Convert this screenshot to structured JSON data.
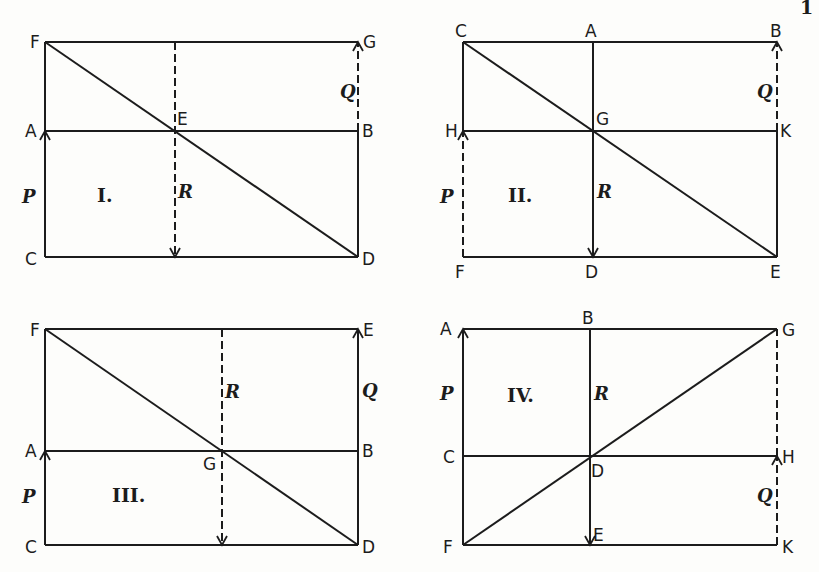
{
  "figure": {
    "corner_mark": "1"
  },
  "panels": [
    {
      "numeral": "I.",
      "points": {
        "F": [
          45,
          42
        ],
        "G": [
          358,
          42
        ],
        "A": [
          45,
          131
        ],
        "E": [
          175,
          131
        ],
        "B": [
          358,
          131
        ],
        "C": [
          45,
          257
        ],
        "D": [
          358,
          257
        ]
      },
      "labels": [
        {
          "text": "F",
          "x": 30,
          "y": 48
        },
        {
          "text": "G",
          "x": 363,
          "y": 48
        },
        {
          "text": "A",
          "x": 25,
          "y": 137
        },
        {
          "text": "E",
          "x": 177,
          "y": 125
        },
        {
          "text": "B",
          "x": 362,
          "y": 137
        },
        {
          "text": "C",
          "x": 25,
          "y": 265
        },
        {
          "text": "D",
          "x": 362,
          "y": 265
        }
      ],
      "forces": [
        {
          "text": "P",
          "x": 22,
          "y": 203
        },
        {
          "text": "Q",
          "x": 340,
          "y": 98
        },
        {
          "text": "R",
          "x": 178,
          "y": 198
        }
      ],
      "numeral_pos": [
        97,
        202
      ],
      "lines": [
        {
          "from": "F",
          "to": "G",
          "style": "solid"
        },
        {
          "from": "A",
          "to": "B",
          "style": "solid"
        },
        {
          "from": "C",
          "to": "D",
          "style": "solid"
        },
        {
          "from": "C",
          "to": "F",
          "style": "solid"
        },
        {
          "from": "B",
          "to": "D",
          "style": "solid"
        },
        {
          "from": "F",
          "to": "D",
          "style": "solid",
          "name": "diagonal"
        },
        {
          "from": [
            175,
            42
          ],
          "to": [
            175,
            257
          ],
          "style": "dashed",
          "arrow": "end",
          "name": "resultant-R"
        },
        {
          "from": "B",
          "to": "G",
          "style": "dashed",
          "arrow": "end",
          "name": "force-Q"
        },
        {
          "from": "C",
          "to": "A",
          "style": "solid",
          "arrow": "end",
          "name": "force-P"
        }
      ]
    },
    {
      "numeral": "II.",
      "points": {
        "C": [
          463,
          42
        ],
        "A": [
          593,
          42
        ],
        "B": [
          777,
          42
        ],
        "H": [
          463,
          131
        ],
        "G": [
          593,
          131
        ],
        "K": [
          777,
          131
        ],
        "F": [
          463,
          257
        ],
        "D": [
          593,
          257
        ],
        "E": [
          777,
          257
        ]
      },
      "labels": [
        {
          "text": "C",
          "x": 455,
          "y": 37
        },
        {
          "text": "A",
          "x": 585,
          "y": 37
        },
        {
          "text": "B",
          "x": 770,
          "y": 37
        },
        {
          "text": "H",
          "x": 445,
          "y": 137
        },
        {
          "text": "G",
          "x": 596,
          "y": 125
        },
        {
          "text": "K",
          "x": 780,
          "y": 137
        },
        {
          "text": "F",
          "x": 455,
          "y": 278
        },
        {
          "text": "D",
          "x": 585,
          "y": 278
        },
        {
          "text": "E",
          "x": 770,
          "y": 278
        }
      ],
      "forces": [
        {
          "text": "P",
          "x": 440,
          "y": 203
        },
        {
          "text": "Q",
          "x": 757,
          "y": 98
        },
        {
          "text": "R",
          "x": 597,
          "y": 198
        }
      ],
      "numeral_pos": [
        508,
        202
      ],
      "lines": [
        {
          "from": "C",
          "to": "B",
          "style": "solid"
        },
        {
          "from": "H",
          "to": "K",
          "style": "solid"
        },
        {
          "from": "F",
          "to": "E",
          "style": "solid"
        },
        {
          "from": "C",
          "to": "H",
          "style": "solid"
        },
        {
          "from": "K",
          "to": "E",
          "style": "solid"
        },
        {
          "from": "C",
          "to": "E",
          "style": "solid",
          "name": "diagonal"
        },
        {
          "from": "A",
          "to": "D",
          "style": "solid",
          "arrow": "end",
          "name": "resultant-R"
        },
        {
          "from": "K",
          "to": "B",
          "style": "dashed",
          "arrow": "end",
          "name": "force-Q"
        },
        {
          "from": "F",
          "to": "H",
          "style": "dashed",
          "arrow": "end",
          "name": "force-P"
        }
      ]
    },
    {
      "numeral": "III.",
      "points": {
        "F": [
          45,
          329
        ],
        "E": [
          358,
          329
        ],
        "A": [
          45,
          451
        ],
        "G": [
          222,
          451
        ],
        "B": [
          358,
          451
        ],
        "C": [
          45,
          545
        ],
        "D": [
          358,
          545
        ]
      },
      "labels": [
        {
          "text": "F",
          "x": 30,
          "y": 336
        },
        {
          "text": "E",
          "x": 363,
          "y": 336
        },
        {
          "text": "A",
          "x": 25,
          "y": 457
        },
        {
          "text": "G",
          "x": 203,
          "y": 470
        },
        {
          "text": "B",
          "x": 362,
          "y": 457
        },
        {
          "text": "C",
          "x": 25,
          "y": 553
        },
        {
          "text": "D",
          "x": 362,
          "y": 553
        }
      ],
      "forces": [
        {
          "text": "P",
          "x": 22,
          "y": 503
        },
        {
          "text": "Q",
          "x": 362,
          "y": 397
        },
        {
          "text": "R",
          "x": 225,
          "y": 398
        }
      ],
      "numeral_pos": [
        112,
        502
      ],
      "lines": [
        {
          "from": "F",
          "to": "E",
          "style": "solid"
        },
        {
          "from": "A",
          "to": "B",
          "style": "solid"
        },
        {
          "from": "C",
          "to": "D",
          "style": "solid"
        },
        {
          "from": "C",
          "to": "F",
          "style": "solid"
        },
        {
          "from": "D",
          "to": "B",
          "style": "solid"
        },
        {
          "from": "F",
          "to": "D",
          "style": "solid",
          "name": "diagonal"
        },
        {
          "from": [
            222,
            329
          ],
          "to": [
            222,
            545
          ],
          "style": "dashed",
          "arrow": "end",
          "name": "resultant-R"
        },
        {
          "from": "B",
          "to": "E",
          "style": "solid",
          "arrow": "end",
          "name": "force-Q"
        },
        {
          "from": "C",
          "to": "A",
          "style": "solid",
          "arrow": "end",
          "name": "force-P"
        }
      ]
    },
    {
      "numeral": "IV.",
      "points": {
        "A": [
          463,
          329
        ],
        "B": [
          590,
          329
        ],
        "G": [
          777,
          329
        ],
        "C": [
          463,
          456
        ],
        "D": [
          590,
          456
        ],
        "H": [
          777,
          456
        ],
        "F": [
          463,
          545
        ],
        "E": [
          590,
          545
        ],
        "K": [
          777,
          545
        ]
      },
      "labels": [
        {
          "text": "A",
          "x": 440,
          "y": 335
        },
        {
          "text": "B",
          "x": 582,
          "y": 324
        },
        {
          "text": "G",
          "x": 782,
          "y": 336
        },
        {
          "text": "C",
          "x": 443,
          "y": 463
        },
        {
          "text": "D",
          "x": 591,
          "y": 477
        },
        {
          "text": "H",
          "x": 782,
          "y": 463
        },
        {
          "text": "F",
          "x": 443,
          "y": 553
        },
        {
          "text": "E",
          "x": 593,
          "y": 541
        },
        {
          "text": "K",
          "x": 782,
          "y": 553
        }
      ],
      "forces": [
        {
          "text": "P",
          "x": 440,
          "y": 400
        },
        {
          "text": "Q",
          "x": 757,
          "y": 502
        },
        {
          "text": "R",
          "x": 594,
          "y": 400
        }
      ],
      "numeral_pos": [
        507,
        402
      ],
      "lines": [
        {
          "from": "A",
          "to": "G",
          "style": "solid"
        },
        {
          "from": "C",
          "to": "H",
          "style": "solid"
        },
        {
          "from": "F",
          "to": "K",
          "style": "solid"
        },
        {
          "from": "C",
          "to": "F",
          "style": "solid"
        },
        {
          "from": "F",
          "to": "G",
          "style": "solid",
          "name": "diagonal"
        },
        {
          "from": "F",
          "to": "A",
          "style": "solid",
          "arrow": "end",
          "name": "force-P"
        },
        {
          "from": "B",
          "to": "E",
          "style": "solid",
          "arrow": "end",
          "name": "resultant-R"
        },
        {
          "from": "H",
          "to": "G",
          "style": "dashed",
          "name": "upper-right-side"
        },
        {
          "from": "K",
          "to": "H",
          "style": "dashed",
          "arrow": "end",
          "name": "force-Q"
        }
      ]
    }
  ]
}
